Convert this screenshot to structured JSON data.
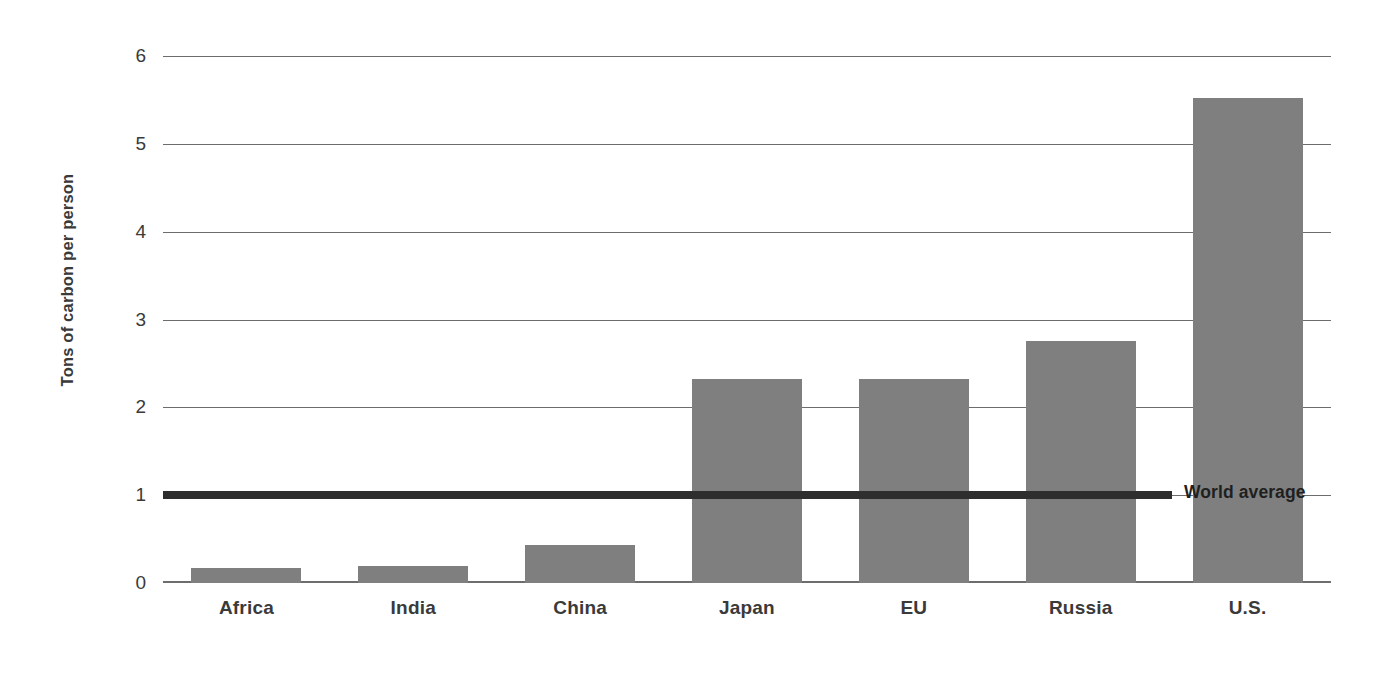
{
  "chart_data": {
    "type": "bar",
    "title": "",
    "subtitle": "",
    "xlabel": "",
    "ylabel": "Tons of carbon per person",
    "categories": [
      "Africa",
      "India",
      "China",
      "Japan",
      "EU",
      "Russia",
      "U.S."
    ],
    "values": [
      0.17,
      0.19,
      0.43,
      2.32,
      2.32,
      2.76,
      5.52
    ],
    "series": [
      {
        "name": "Tons of carbon per person",
        "values": [
          0.17,
          0.19,
          0.43,
          2.32,
          2.32,
          2.76,
          5.52
        ]
      }
    ],
    "ylim": [
      0,
      6
    ],
    "y_ticks": [
      0,
      1,
      2,
      3,
      4,
      5,
      6
    ],
    "y_tick_labels": [
      "0",
      "1",
      "2",
      "3",
      "4",
      "5",
      "6"
    ],
    "grid": true,
    "grid_axis": "y",
    "legend": false,
    "legend_position": "none",
    "annotations": [
      {
        "name": "world-average",
        "label": "World average",
        "type": "horizontal-line",
        "value": 1.0
      }
    ],
    "colors": {
      "bar": "#7f7f7f",
      "gridline": "#6d6d6d",
      "world_average_line": "#2e2e2e",
      "text": "#3a3a3a",
      "background": "#ffffff"
    }
  }
}
